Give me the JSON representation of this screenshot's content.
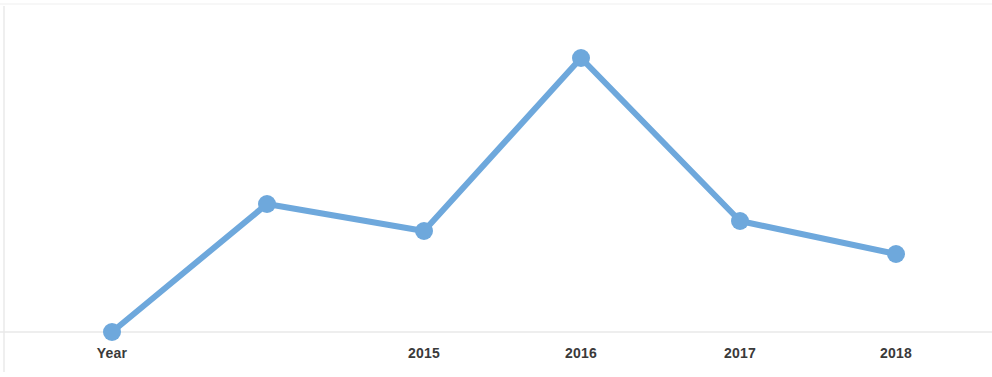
{
  "chart_data": {
    "type": "line",
    "title": "",
    "subtitle": "",
    "xlabel": "",
    "ylabel": "",
    "categories": [
      "Year",
      "",
      "2015",
      "2016",
      "2017",
      "2018"
    ],
    "tick_labels": [
      "Year",
      "",
      "2015",
      "2016",
      "2017",
      "2018"
    ],
    "values": [
      0,
      57,
      45,
      123,
      50,
      35
    ],
    "series": [
      {
        "name": "",
        "values": [
          0,
          57,
          45,
          123,
          50,
          35
        ]
      }
    ],
    "points": [
      {
        "label": "Year",
        "x": 112,
        "y": 332,
        "value": 0
      },
      {
        "label": "",
        "x": 267,
        "y": 204,
        "value": 57
      },
      {
        "label": "2015",
        "x": 424,
        "y": 231,
        "value": 45
      },
      {
        "label": "2016",
        "x": 581,
        "y": 58,
        "value": 123
      },
      {
        "label": "2017",
        "x": 740,
        "y": 221,
        "value": 50
      },
      {
        "label": "2018",
        "x": 896,
        "y": 254,
        "value": 35
      }
    ],
    "ylim": [
      0,
      140
    ],
    "xlim": [
      0,
      992
    ],
    "grid": false,
    "baseline_y": 332,
    "legend": [],
    "legend_position": "none",
    "annotations": [],
    "colors": {
      "line": "#6ea8dc",
      "marker": "#6ea8dc",
      "background": "#ffffff",
      "axis": "#e8e8e8",
      "label_text": "#3a3a3a"
    },
    "style": {
      "line_width": 6,
      "marker_radius": 9
    }
  },
  "axis": {
    "tick_label_y": 346
  }
}
